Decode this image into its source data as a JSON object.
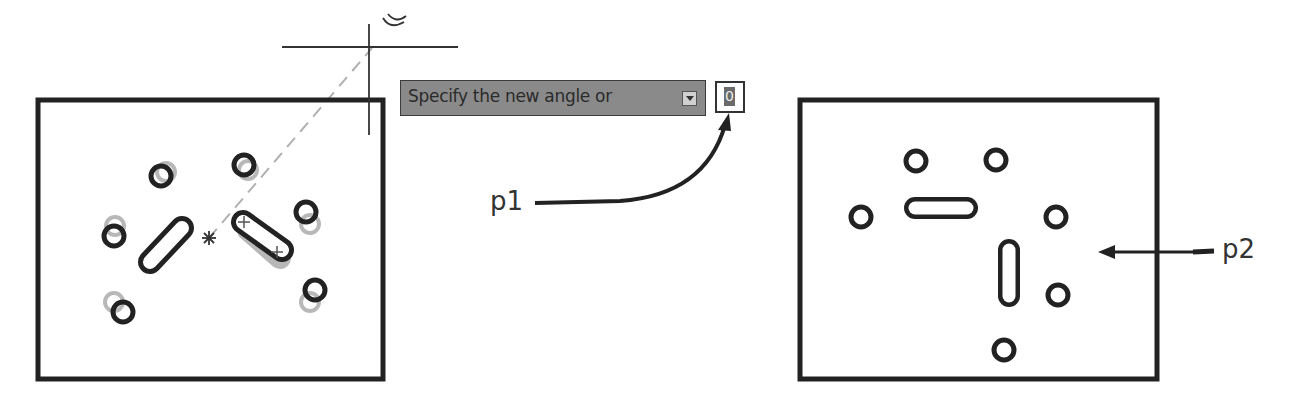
{
  "prompt": {
    "text": "Specify the new angle or",
    "dropdown_icon": "dropdown-arrow-icon",
    "input_value": "0"
  },
  "annotations": {
    "p1": "p1",
    "p2": "p2"
  },
  "drawing": {
    "left_panel": {
      "description": "Rotated part preview with ghost original positions",
      "holes": 6,
      "slots": 2,
      "base_point_icon": "asterisk-icon"
    },
    "right_panel": {
      "description": "Resulting part after rotation",
      "holes": 6,
      "slots": 2
    }
  },
  "colors": {
    "line": "#222222",
    "ghost": "#b5b5b5",
    "prompt_bg": "#8a8a8a",
    "rubberband": "#b0b0b0"
  }
}
